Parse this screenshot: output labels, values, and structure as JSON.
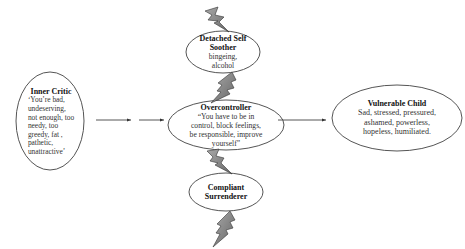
{
  "diagram": {
    "nodes": {
      "inner_critic": {
        "title": "Inner Critic",
        "description": "‘You’re bad,\nundeserving,\nnot enough, too\nneedy, too\ngreedy, fat ,\npathetic,\nunattractive’"
      },
      "detached_self_soother": {
        "title": "Detached Self Soother",
        "description": "bingeing,\nalcohol"
      },
      "overcontroller": {
        "title": "Overcontroller",
        "description": "“You have to be in\ncontrol, block feelings,\nbe responsible, improve\nyourself”"
      },
      "compliant_surrenderer": {
        "title": "Compliant Surrenderer",
        "description": ""
      },
      "vulnerable_child": {
        "title": "Vulnerable Child",
        "description": "Sad, stressed,  pressured,\nashamed, powerless,\nhopeless, humiliated."
      }
    },
    "edges": [
      {
        "from": "inner_critic",
        "to": "overcontroller",
        "type": "arrow",
        "segments": 2
      },
      {
        "from": "overcontroller",
        "to": "vulnerable_child",
        "type": "arrow"
      }
    ],
    "lightning_bolts": [
      {
        "position": "above-detached-self-soother"
      },
      {
        "position": "between-detached-and-overcontroller"
      },
      {
        "position": "between-overcontroller-and-compliant"
      },
      {
        "position": "below-compliant-surrenderer"
      }
    ],
    "colors": {
      "stroke": "#555555",
      "bolt_fill": "#8a8a8a",
      "bolt_stroke": "#333333",
      "arrow": "#444444"
    }
  }
}
